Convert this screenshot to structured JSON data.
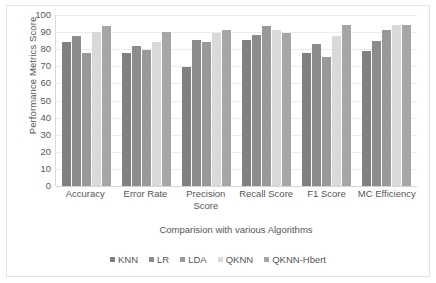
{
  "chart_data": {
    "type": "bar",
    "title": "",
    "xlabel": "Comparision with various Algorithms",
    "ylabel": "Performance Metrics Score",
    "ylim": [
      0,
      100
    ],
    "ytick_step": 10,
    "yticks": [
      "100",
      "90",
      "80",
      "70",
      "60",
      "50",
      "40",
      "30",
      "20",
      "10",
      "0"
    ],
    "grid": true,
    "legend_position": "bottom",
    "categories": [
      "Accuracy",
      "Error Rate",
      "Precision Score",
      "Recall Score",
      "F1 Score",
      "MC Efficiency"
    ],
    "category_lines": [
      [
        "Accuracy"
      ],
      [
        "Error Rate"
      ],
      [
        "Precision",
        "Score"
      ],
      [
        "Recall Score"
      ],
      [
        "F1 Score"
      ],
      [
        "MC Efficiency"
      ]
    ],
    "series": [
      {
        "name": "KNN",
        "color": "#808080",
        "values": [
          84.5,
          77.8,
          69.5,
          85.3,
          77.5,
          79.2
        ]
      },
      {
        "name": "LR",
        "color": "#8c8c8c",
        "values": [
          88.0,
          81.8,
          85.5,
          88.2,
          83.3,
          85.0
        ]
      },
      {
        "name": "LDA",
        "color": "#999999",
        "values": [
          78.0,
          79.7,
          84.3,
          93.4,
          75.3,
          91.0
        ]
      },
      {
        "name": "QKNN",
        "color": "#d9d9d9",
        "values": [
          90.0,
          84.0,
          89.5,
          91.2,
          88.0,
          94.0
        ]
      },
      {
        "name": "QKNN-Hbert",
        "color": "#a6a6a6",
        "values": [
          93.5,
          89.8,
          91.4,
          89.3,
          94.3,
          94.0
        ]
      }
    ]
  },
  "legend": {
    "items": [
      {
        "label": "KNN"
      },
      {
        "label": "LR"
      },
      {
        "label": "LDA"
      },
      {
        "label": "QKNN"
      },
      {
        "label": "QKNN-Hbert"
      }
    ]
  }
}
